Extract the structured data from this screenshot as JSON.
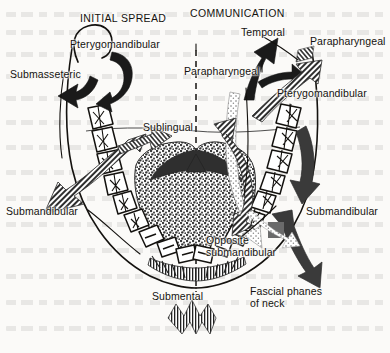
{
  "figure": {
    "headers": {
      "left": "INITIAL SPREAD",
      "right": "COMMUNICATION"
    }
  },
  "labels": {
    "pterygomandibular_left": "Pterygomandibular",
    "submasseteric": "Submasseteric",
    "submandibular_left": "Submandibular",
    "sublingual": "Sublingual",
    "submental": "Submental",
    "temporal": "Temporal",
    "parapharyngeal_mid": "Parapharyngeal",
    "parapharyngeal_right": "Parapharyngeal",
    "pterygomandibular_right": "Pterygomandibular",
    "submandibular_right": "Submandibular",
    "opposite_submandibular": "Opposite\nsubmandibular",
    "fascial_planes_of_neck": "Fascial phanes\nof neck"
  },
  "colors": {
    "ink": "#14120f",
    "paper": "#fbfaf8",
    "arrow_solid": "#1a1a1a",
    "arrow_hatched": "#3d3d3d",
    "tongue_stipple": "#4a4a4a",
    "tooth_fill": "#ffffff"
  },
  "anatomy": {
    "arch_side_teeth_per_side": 8,
    "midline": "dashed vertical line",
    "tongue_region": "stippled dorsum of tongue",
    "mandible_outline": "U-shaped body of mandible"
  }
}
